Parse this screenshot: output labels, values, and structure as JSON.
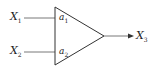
{
  "diagram": {
    "type": "weighted-summing-node",
    "inputs": [
      {
        "name": "X",
        "sub": "1",
        "weight": "a",
        "weight_sub": "1"
      },
      {
        "name": "X",
        "sub": "2",
        "weight": "a",
        "weight_sub": "2"
      }
    ],
    "output": {
      "name": "X",
      "sub": "3"
    },
    "colors": {
      "stroke": "#333333",
      "text": "#222222",
      "background": "#ffffff"
    }
  }
}
